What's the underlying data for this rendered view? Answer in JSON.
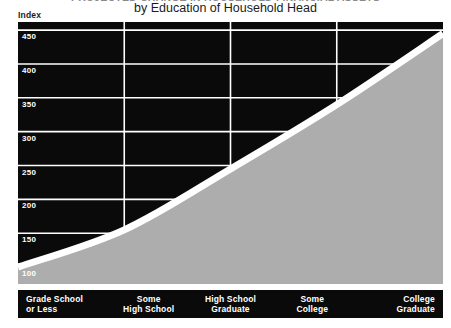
{
  "chart": {
    "title": "PROJECTED CHANGE IN HOUSEHOLD FINANCIAL ASSETS",
    "subtitle": "by Education of Household Head",
    "axis_caption": "Index"
  },
  "chart_data": {
    "type": "area",
    "title": "PROJECTED CHANGE IN HOUSEHOLD FINANCIAL ASSETS",
    "subtitle": "by Education of Household Head",
    "xlabel": "",
    "ylabel": "Index",
    "categories": [
      "Grade School or Less",
      "Some High School",
      "High School Graduate",
      "Some College",
      "College Graduate"
    ],
    "category_lines": [
      [
        "Grade School",
        "or Less"
      ],
      [
        "Some",
        "High School"
      ],
      [
        "High School",
        "Graduate"
      ],
      [
        "Some",
        "College"
      ],
      [
        "College",
        "Graduate"
      ]
    ],
    "values": [
      100,
      155,
      245,
      340,
      445
    ],
    "ylim": [
      75,
      462
    ],
    "yticks": [
      450,
      400,
      350,
      300,
      250,
      200,
      150,
      100
    ],
    "grid": true,
    "legend": "none",
    "colors": {
      "plot_background": "#0a0a0a",
      "area_fill": "#adadad",
      "area_border": "#ffffff",
      "gridline": "#ffffff",
      "tick_label": "#ffffff",
      "category_band": "#0a0a0a",
      "category_label": "#ffffff",
      "page_background": "#ffffff"
    }
  }
}
